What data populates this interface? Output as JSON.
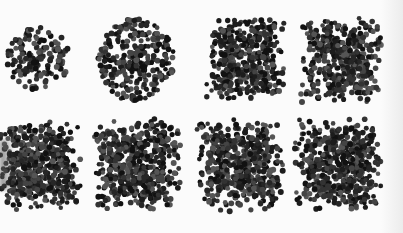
{
  "figure": {
    "background": "#fbfbfb",
    "dot_colors": [
      "#111111",
      "#1c1c1c",
      "#262626",
      "#333333",
      "#444444",
      "#555555"
    ],
    "dot_radius": 2.6,
    "panels": [
      {
        "id": "r1c1",
        "cx": 38,
        "cy": 58,
        "shape": "round",
        "w": 62,
        "h": 64,
        "count": 150,
        "seed": 11
      },
      {
        "id": "r1c2",
        "cx": 136,
        "cy": 60,
        "shape": "round",
        "w": 76,
        "h": 84,
        "count": 300,
        "seed": 23
      },
      {
        "id": "r1c3",
        "cx": 245,
        "cy": 60,
        "shape": "square",
        "w": 80,
        "h": 84,
        "count": 420,
        "seed": 37
      },
      {
        "id": "r1c4",
        "cx": 340,
        "cy": 60,
        "shape": "square",
        "w": 80,
        "h": 84,
        "count": 420,
        "seed": 41
      },
      {
        "id": "r2c1",
        "cx": 40,
        "cy": 165,
        "shape": "square",
        "w": 80,
        "h": 90,
        "count": 520,
        "seed": 53
      },
      {
        "id": "r2c2",
        "cx": 138,
        "cy": 165,
        "shape": "square",
        "w": 84,
        "h": 90,
        "count": 520,
        "seed": 67
      },
      {
        "id": "r2c3",
        "cx": 240,
        "cy": 165,
        "shape": "square",
        "w": 86,
        "h": 90,
        "count": 520,
        "seed": 71
      },
      {
        "id": "r2c4",
        "cx": 338,
        "cy": 165,
        "shape": "square",
        "w": 86,
        "h": 90,
        "count": 520,
        "seed": 89
      }
    ]
  }
}
